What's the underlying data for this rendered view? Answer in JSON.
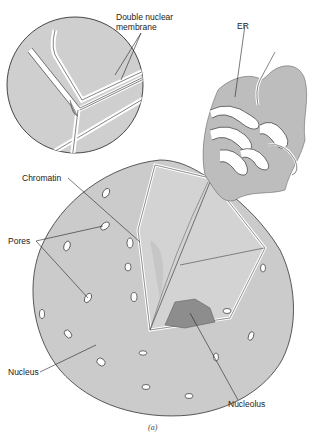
{
  "figure": {
    "caption": "(a)",
    "colors": {
      "nucleus_fill": "#c8c8c8",
      "er_fill": "#bdbdbd",
      "nucleolus_fill": "#8a8a8a",
      "outline": "#333333",
      "membrane_gap": "#ffffff"
    }
  },
  "labels": {
    "double_membrane_line1": "Double nuclear",
    "double_membrane_line2": "membrane",
    "er": "ER",
    "chromatin": "Chromatin",
    "pores": "Pores",
    "nucleus": "Nucleus",
    "nucleolus": "Nucleolus"
  }
}
